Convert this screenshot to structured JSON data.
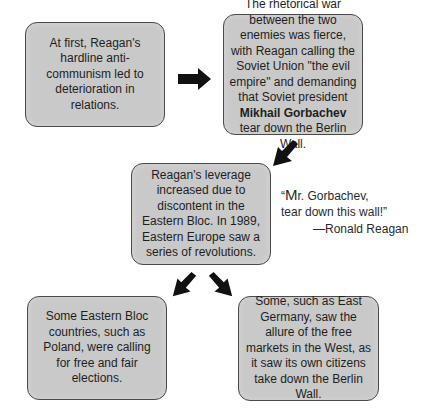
{
  "diagram": {
    "type": "flowchart",
    "boxes": [
      {
        "id": "box-1",
        "text": "At first, Reagan's hardline anti-communism led to deterioration in relations."
      },
      {
        "id": "box-2",
        "text_before_bold": "The rhetorical war between the two enemies was fierce, with Reagan calling the Soviet Union \"the evil empire\" and demanding that Soviet president ",
        "bold": "Mikhail Gorbachev",
        "text_after_bold": " tear down the Berlin Wall."
      },
      {
        "id": "box-3",
        "text": "Reagan's leverage increased due to discontent in the Eastern Bloc. In 1989, Eastern Europe saw a series of revolutions."
      },
      {
        "id": "box-4",
        "text": "Some Eastern Bloc countries, such as Poland, were calling for free and fair elections."
      },
      {
        "id": "box-5",
        "text": "Some, such as East Germany, saw the allure of the free markets in the West, as it saw its own citizens take down the Berlin Wall."
      }
    ],
    "arrows": [
      {
        "from": "box-1",
        "to": "box-2",
        "direction": "right"
      },
      {
        "from": "box-2",
        "to": "box-3",
        "direction": "down-left"
      },
      {
        "from": "box-3",
        "to": "box-4",
        "direction": "down-left"
      },
      {
        "from": "box-3",
        "to": "box-5",
        "direction": "down-right"
      }
    ],
    "quote": {
      "open_mark": "“",
      "big_letter": "M",
      "line1_rest": "r. Gorbachev,",
      "line2": "tear down this wall!”",
      "attribution": "—Ronald Reagan"
    },
    "colors": {
      "box_fill": "#c9c9c9",
      "box_border": "#4a4a4a",
      "arrow": "#111111",
      "text": "#1e1e1e"
    }
  }
}
